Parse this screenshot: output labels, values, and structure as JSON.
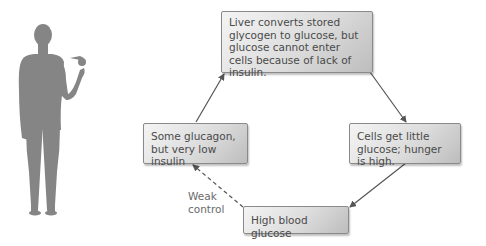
{
  "diagram": {
    "nodes": {
      "top": "Liver converts stored glycogen to glucose, but glucose cannot enter cells because of lack of insulin.",
      "right": "Cells get little glucose; hunger is high.",
      "bottom": "High blood glucose",
      "left": "Some glucagon, but very low insulin"
    },
    "edge_label": "Weak control",
    "edge_label_lines": [
      "Weak",
      "control"
    ],
    "colors": {
      "figure": "#858585",
      "arrow": "#555555",
      "box_border": "#8a8a8a",
      "text": "#4a4a4a"
    }
  }
}
